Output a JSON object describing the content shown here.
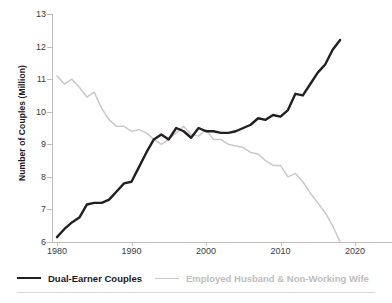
{
  "chart_data": {
    "type": "line",
    "title": "",
    "xlabel": "",
    "ylabel": "Number of Couples (Million)",
    "xlim": [
      1980,
      2020
    ],
    "ylim": [
      6,
      13
    ],
    "yticks": [
      6,
      7,
      8,
      9,
      10,
      11,
      12,
      13
    ],
    "xticks": [
      1980,
      1990,
      2000,
      2010,
      2020
    ],
    "grid": false,
    "legend_position": "bottom",
    "x": [
      1980,
      1981,
      1982,
      1983,
      1984,
      1985,
      1986,
      1987,
      1988,
      1989,
      1990,
      1991,
      1992,
      1993,
      1994,
      1995,
      1996,
      1997,
      1998,
      1999,
      2000,
      2001,
      2002,
      2003,
      2004,
      2005,
      2006,
      2007,
      2008,
      2009,
      2010,
      2011,
      2012,
      2013,
      2014,
      2015,
      2016,
      2017,
      2018
    ],
    "series": [
      {
        "name": "Dual-Earner Couples",
        "color": "#231f20",
        "values": [
          6.15,
          6.4,
          6.6,
          6.75,
          7.15,
          7.2,
          7.2,
          7.3,
          7.55,
          7.8,
          7.85,
          8.3,
          8.75,
          9.15,
          9.3,
          9.15,
          9.5,
          9.4,
          9.2,
          9.5,
          9.4,
          9.4,
          9.35,
          9.35,
          9.4,
          9.5,
          9.6,
          9.8,
          9.75,
          9.9,
          9.85,
          10.05,
          10.55,
          10.5,
          10.85,
          11.2,
          11.45,
          11.9,
          12.2
        ]
      },
      {
        "name": "Employed Husband & Non-Working Wife",
        "color": "#c9c9c9",
        "values": [
          11.1,
          10.85,
          11.0,
          10.75,
          10.45,
          10.6,
          10.1,
          9.75,
          9.55,
          9.55,
          9.4,
          9.45,
          9.35,
          9.15,
          9.0,
          9.15,
          9.35,
          9.55,
          9.3,
          9.25,
          9.45,
          9.15,
          9.15,
          9.0,
          8.95,
          8.9,
          8.75,
          8.7,
          8.5,
          8.35,
          8.35,
          8.0,
          8.1,
          7.85,
          7.5,
          7.2,
          6.9,
          6.5,
          6.0
        ]
      }
    ]
  },
  "axes": {
    "ylabel": "Number of Couples (Million)",
    "ytick_labels": [
      "13",
      "12",
      "11",
      "10",
      "9",
      "8",
      "7",
      "6"
    ],
    "xtick_labels": [
      "1980",
      "1990",
      "2000",
      "2010",
      "2020"
    ]
  },
  "legend": {
    "items": [
      {
        "label": "Dual-Earner Couples",
        "color": "#231f20"
      },
      {
        "label": "Employed Husband & Non-Working Wife",
        "color": "#c9c9c9"
      }
    ]
  }
}
